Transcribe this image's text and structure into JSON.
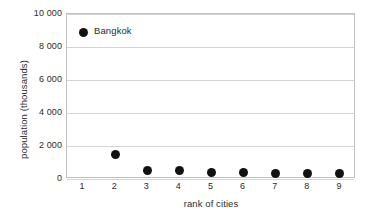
{
  "chart_data": {
    "type": "scatter",
    "title": "",
    "xlabel": "rank of cities",
    "ylabel": "population (thousands)",
    "x": [
      1,
      2,
      3,
      4,
      5,
      6,
      7,
      8,
      9
    ],
    "values": [
      8900,
      1500,
      520,
      490,
      420,
      370,
      360,
      340,
      320
    ],
    "series": [
      {
        "name": "city population by rank",
        "x": [
          1,
          2,
          3,
          4,
          5,
          6,
          7,
          8,
          9
        ],
        "values": [
          8900,
          1500,
          520,
          490,
          420,
          370,
          360,
          340,
          320
        ]
      }
    ],
    "xlim": [
      0.5,
      9.5
    ],
    "ylim": [
      0,
      10000
    ],
    "x_tick_labels": [
      "1",
      "2",
      "3",
      "4",
      "5",
      "6",
      "7",
      "8",
      "9"
    ],
    "y_tick_values": [
      0,
      2000,
      4000,
      6000,
      8000,
      10000
    ],
    "y_tick_labels": [
      "0",
      "2 000",
      "4 000",
      "6 000",
      "8 000",
      "10 000"
    ],
    "grid": "horizontal",
    "legend": "none",
    "marker_color": "#111111",
    "gridline_color": "#d4d4d4",
    "axis_color": "#bfbfbf",
    "annotations": [
      {
        "text": "Bangkok",
        "x": 1,
        "y": 8900
      }
    ]
  }
}
